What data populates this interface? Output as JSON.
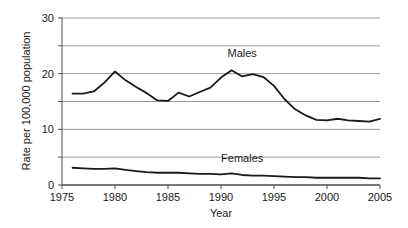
{
  "chart_data": {
    "type": "line",
    "title": "",
    "subtitle": "",
    "xlabel": "Year",
    "ylabel": "Rate per 100,000 population",
    "xlim": [
      1975,
      2005
    ],
    "ylim": [
      0,
      30
    ],
    "grid": true,
    "grid_axis": "y",
    "legend_position": "inline-annotation",
    "x_ticks": [
      1975,
      1980,
      1985,
      1990,
      1995,
      2000,
      2005
    ],
    "x_tick_labels": [
      "1975",
      "1980",
      "1985",
      "1990",
      "1995",
      "2000",
      "2005"
    ],
    "y_ticks": [
      0,
      5,
      10,
      15,
      20,
      25,
      30
    ],
    "y_tick_labels": [
      "0",
      "",
      "10",
      "",
      "20",
      "",
      "30"
    ],
    "y_labeled_ticks": [
      0,
      10,
      20,
      30
    ],
    "x": [
      1976,
      1977,
      1978,
      1979,
      1980,
      1981,
      1982,
      1983,
      1984,
      1985,
      1986,
      1987,
      1988,
      1989,
      1990,
      1991,
      1992,
      1993,
      1994,
      1995,
      1996,
      1997,
      1998,
      1999,
      2000,
      2001,
      2002,
      2003,
      2004,
      2005
    ],
    "series": [
      {
        "name": "Males",
        "color": "#1a1a1a",
        "label_x": 1992,
        "label_y": 23.0,
        "values": [
          16.4,
          16.4,
          16.8,
          18.4,
          20.4,
          18.8,
          17.6,
          16.5,
          15.2,
          15.1,
          16.6,
          15.9,
          16.7,
          17.5,
          19.3,
          20.6,
          19.5,
          19.9,
          19.4,
          17.8,
          15.4,
          13.6,
          12.5,
          11.7,
          11.6,
          11.9,
          11.6,
          11.5,
          11.4,
          11.9
        ]
      },
      {
        "name": "Females",
        "color": "#1a1a1a",
        "label_x": 1992,
        "label_y": 4.2,
        "values": [
          3.1,
          3.0,
          2.9,
          2.9,
          3.0,
          2.7,
          2.5,
          2.3,
          2.2,
          2.2,
          2.2,
          2.1,
          2.0,
          2.0,
          1.9,
          2.1,
          1.8,
          1.7,
          1.7,
          1.6,
          1.5,
          1.4,
          1.4,
          1.3,
          1.3,
          1.3,
          1.3,
          1.3,
          1.2,
          1.2
        ]
      }
    ]
  },
  "axes": {
    "y_axis_title": "Rate per 100,000 population",
    "x_axis_title": "Year"
  },
  "annotations": {
    "males_label": "Males",
    "females_label": "Females"
  }
}
